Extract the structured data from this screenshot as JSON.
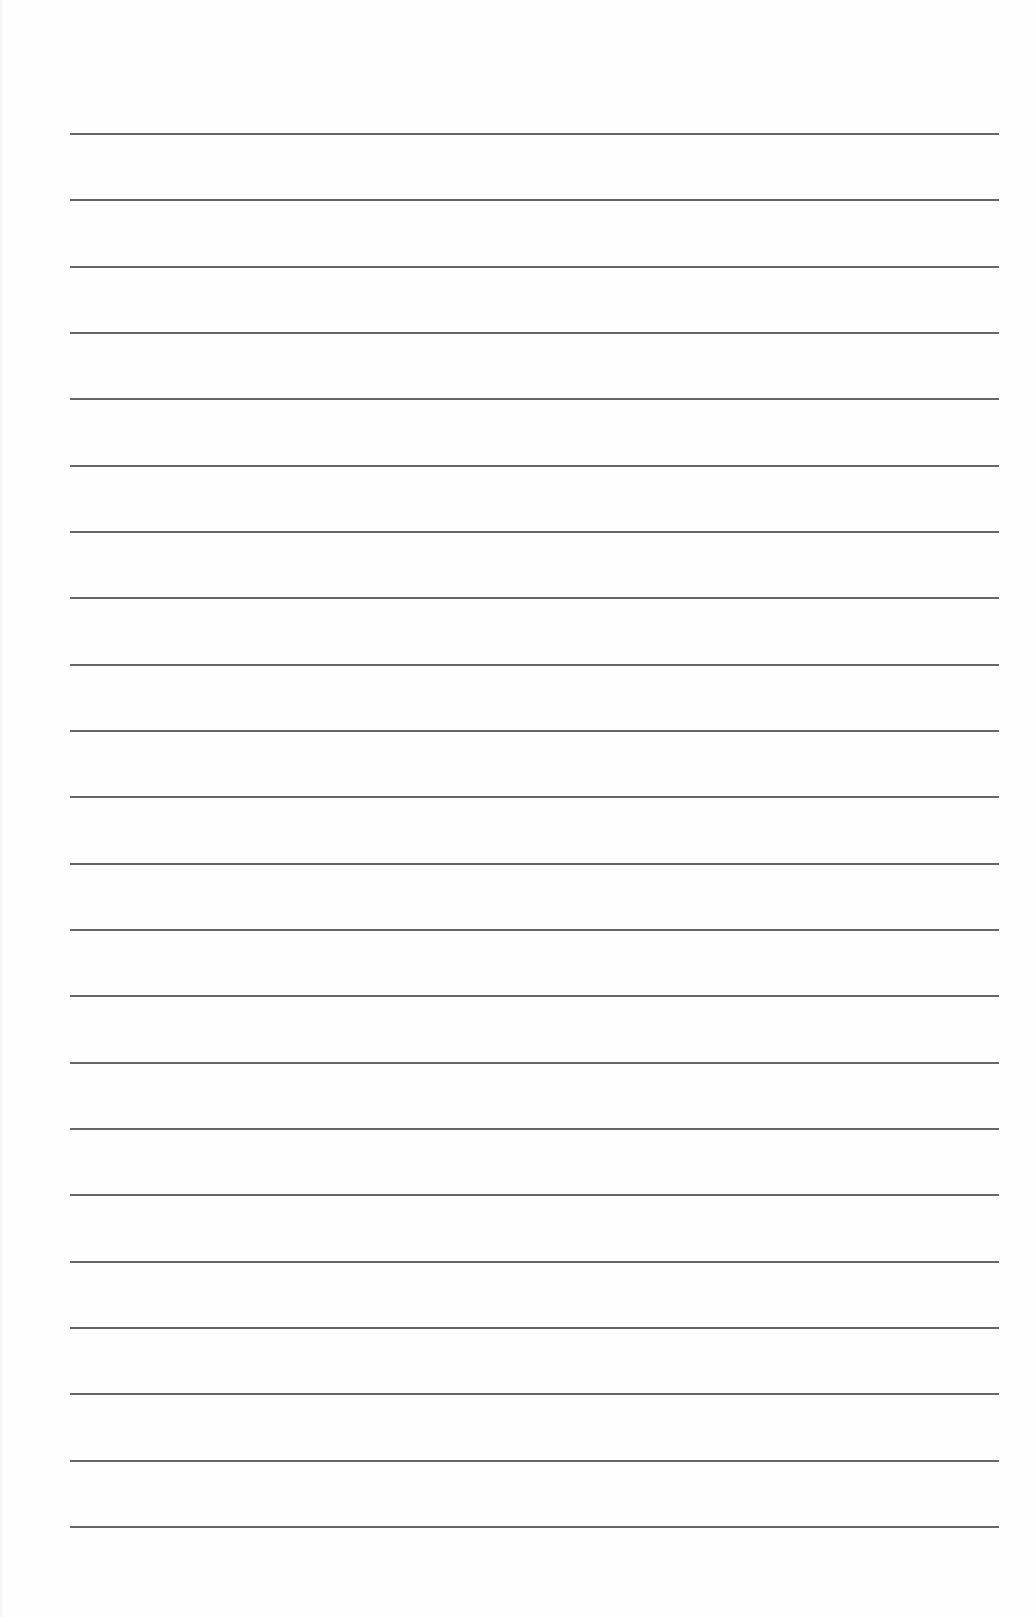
{
  "document": {
    "type": "lined-paper",
    "background_color": "#fefefe",
    "rule_color": "#555555",
    "rules": {
      "count": 22,
      "x_start": 70,
      "x_end": 999,
      "y_first": 133,
      "y_last": 1526
    }
  }
}
